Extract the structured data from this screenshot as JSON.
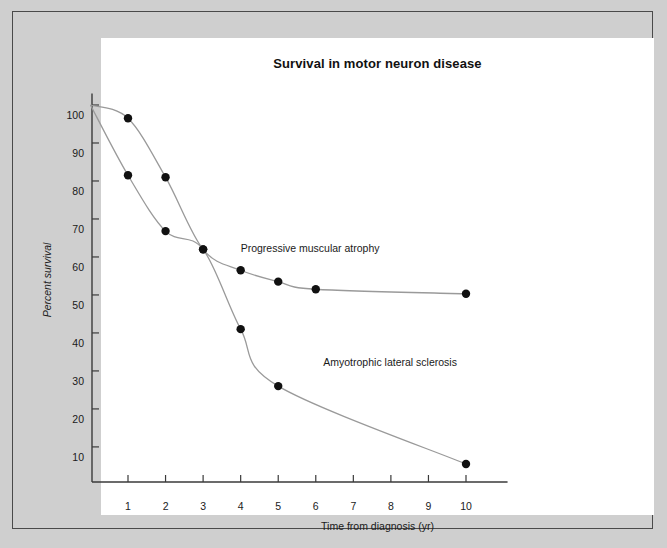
{
  "figure": {
    "background_color": "#cfcfcf",
    "canvas_color": "#ffffff",
    "frame_color": "#4a4a4a"
  },
  "chart_data": {
    "type": "line",
    "title": "Survival in motor neuron disease",
    "xlabel": "Time from diagnosis (yr)",
    "ylabel": "Percent survival",
    "xlim": [
      0,
      11
    ],
    "ylim": [
      0,
      103
    ],
    "xticks": [
      1,
      2,
      3,
      4,
      5,
      6,
      7,
      8,
      9,
      10
    ],
    "xtick_labels": [
      "1",
      "2",
      "3",
      "4",
      "5",
      "6",
      "7",
      "8",
      "9",
      "10"
    ],
    "yticks": [
      10,
      20,
      30,
      40,
      50,
      60,
      70,
      80,
      90,
      100
    ],
    "ytick_labels": [
      "10",
      "20",
      "30",
      "40",
      "50",
      "60",
      "70",
      "80",
      "90",
      "100"
    ],
    "grid": false,
    "legend": "inline-annotations",
    "marker_color": "#111111",
    "line_color": "#9a9a9a",
    "series": [
      {
        "name": "Progressive muscular atrophy",
        "annotation": "Progressive muscular atrophy",
        "annotation_x": 4.0,
        "annotation_y": 65,
        "x": [
          0,
          1,
          2,
          3,
          4,
          5,
          6,
          10
        ],
        "values": [
          100,
          96.5,
          81,
          62,
          56.5,
          53.5,
          51.5,
          50.3
        ]
      },
      {
        "name": "Amyotrophic lateral sclerosis",
        "annotation": "Amyotrophic lateral sclerosis",
        "annotation_x": 6.2,
        "annotation_y": 35,
        "x": [
          0,
          1,
          2,
          3,
          4,
          5,
          10
        ],
        "values": [
          100,
          81.5,
          66.8,
          62,
          41,
          26,
          5.5
        ]
      }
    ]
  }
}
